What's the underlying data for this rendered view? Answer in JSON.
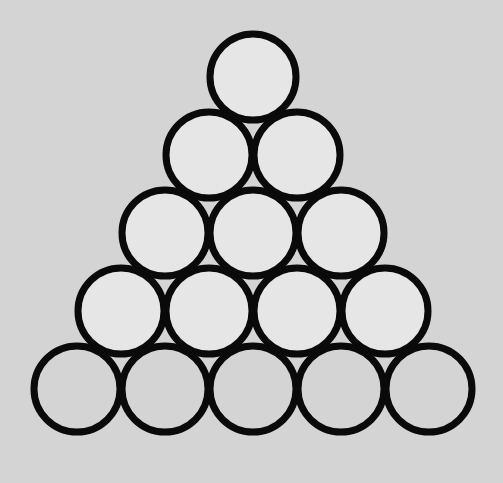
{
  "figure": {
    "background_color": "#d4d4d4",
    "outline_color": "#0a0a0a",
    "rows": [
      {
        "row": 1,
        "count": 1,
        "fill": "#e6e6e6",
        "shaded": true
      },
      {
        "row": 2,
        "count": 2,
        "fill": "#e6e6e6",
        "shaded": true
      },
      {
        "row": 3,
        "count": 3,
        "fill": "#e6e6e6",
        "shaded": true
      },
      {
        "row": 4,
        "count": 4,
        "fill": "#e6e6e6",
        "shaded": true
      },
      {
        "row": 5,
        "count": 5,
        "fill": "#d4d4d4",
        "shaded": false
      }
    ],
    "total_circles": 15,
    "light_circles": 10,
    "background_matching_circles": 5
  }
}
